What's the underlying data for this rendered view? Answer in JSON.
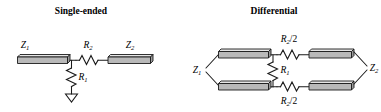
{
  "figure": {
    "name": "single-ended-vs-differential-termination",
    "background_color": "#ffffff",
    "ink_color": "#1b1b1b",
    "bar_fill_color": "#b9b9b9",
    "bar_highlight_color": "#e6e6e6"
  },
  "panels": {
    "left": {
      "title": "Single-ended",
      "labels": {
        "z1": "Z",
        "z1_sub": "1",
        "z2": "Z",
        "z2_sub": "2",
        "r2": "R",
        "r2_sub": "2",
        "r1": "R",
        "r1_sub": "1"
      },
      "components": [
        {
          "name": "transmission-line-z1",
          "type": "transmission-line",
          "label": "Z1"
        },
        {
          "name": "series-resistor-r2",
          "type": "resistor",
          "label": "R2",
          "orientation": "horizontal"
        },
        {
          "name": "shunt-resistor-r1",
          "type": "resistor",
          "label": "R1",
          "orientation": "vertical"
        },
        {
          "name": "ground-symbol",
          "type": "ground"
        },
        {
          "name": "transmission-line-z2",
          "type": "transmission-line",
          "label": "Z2"
        }
      ]
    },
    "right": {
      "title": "Differential",
      "labels": {
        "z1": "Z",
        "z1_sub": "1",
        "z2": "Z",
        "z2_sub": "2",
        "r2_top": "R",
        "r2_top_sub": "2",
        "r2_top_div": "/2",
        "r2_bottom": "R",
        "r2_bottom_sub": "2",
        "r2_bottom_div": "/2",
        "r1": "R",
        "r1_sub": "1"
      },
      "components": [
        {
          "name": "transmission-line-z1-top",
          "type": "transmission-line",
          "label": "Z1"
        },
        {
          "name": "transmission-line-z1-bottom",
          "type": "transmission-line",
          "label": "Z1"
        },
        {
          "name": "series-resistor-r2-half-top",
          "type": "resistor",
          "label": "R2/2",
          "orientation": "horizontal"
        },
        {
          "name": "series-resistor-r2-half-bottom",
          "type": "resistor",
          "label": "R2/2",
          "orientation": "horizontal"
        },
        {
          "name": "bridge-resistor-r1",
          "type": "resistor",
          "label": "R1",
          "orientation": "vertical"
        },
        {
          "name": "transmission-line-z2-top",
          "type": "transmission-line",
          "label": "Z2"
        },
        {
          "name": "transmission-line-z2-bottom",
          "type": "transmission-line",
          "label": "Z2"
        }
      ]
    }
  }
}
